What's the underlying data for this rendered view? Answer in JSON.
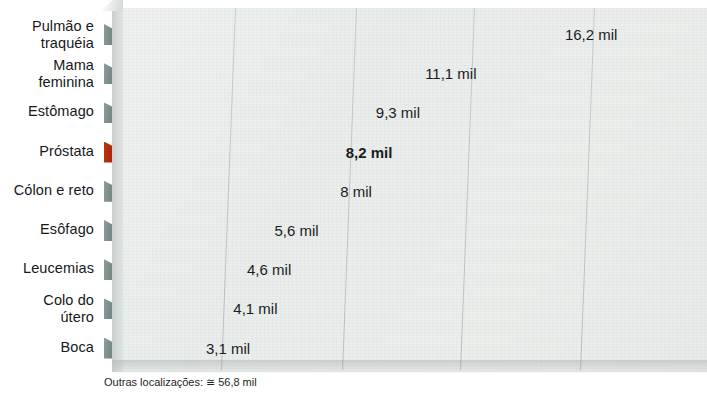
{
  "chart_data": {
    "type": "bar",
    "orientation": "horizontal",
    "title": "",
    "subtitle": "",
    "xlabel": "",
    "ylabel": "",
    "unit_suffix": "mil",
    "categories": [
      "Pulmão e\ntraquéia",
      "Mama\nfeminina",
      "Estômago",
      "Próstata",
      "Cólon e reto",
      "Esôfago",
      "Leucemias",
      "Colo do\nútero",
      "Boca"
    ],
    "values": [
      16.2,
      11.1,
      9.3,
      8.2,
      8.0,
      5.6,
      4.6,
      4.1,
      3.1
    ],
    "value_labels": [
      "16,2 mil",
      "11,1 mil",
      "9,3 mil",
      "8,2 mil",
      "8 mil",
      "5,6 mil",
      "4,6 mil",
      "4,1 mil",
      "3,1 mil"
    ],
    "highlight_index": 3,
    "highlight_color": "#e5401a",
    "bar_color": "#b6c3c0",
    "xlim": [
      0,
      21.7
    ],
    "grid": true,
    "gridlines_at": [
      4.5,
      8.9,
      13.2,
      17.6
    ],
    "legend": "none",
    "footnote": "Outras localizações: ≅ 56,8 mil"
  },
  "footnote": {
    "text": "Outras localizações: ≅ 56,8 mil"
  }
}
